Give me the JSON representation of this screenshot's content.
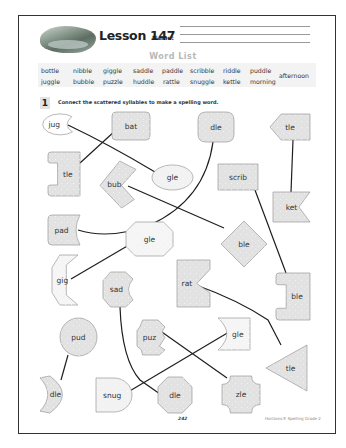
{
  "header": {
    "lesson_title": "Lesson 147",
    "name_label": "Name:"
  },
  "word_list": {
    "title": "Word List",
    "words": [
      {
        "text": "bottle",
        "x": 41,
        "y": 67
      },
      {
        "text": "nibble",
        "x": 73,
        "y": 67
      },
      {
        "text": "giggle",
        "x": 103,
        "y": 67
      },
      {
        "text": "saddle",
        "x": 133,
        "y": 67
      },
      {
        "text": "paddle",
        "x": 162,
        "y": 67
      },
      {
        "text": "scribble",
        "x": 190,
        "y": 67
      },
      {
        "text": "riddle",
        "x": 223,
        "y": 67
      },
      {
        "text": "puddle",
        "x": 250,
        "y": 67
      },
      {
        "text": "juggle",
        "x": 41,
        "y": 78
      },
      {
        "text": "bubble",
        "x": 73,
        "y": 78
      },
      {
        "text": "puzzle",
        "x": 103,
        "y": 78
      },
      {
        "text": "huddle",
        "x": 133,
        "y": 78
      },
      {
        "text": "rattle",
        "x": 163,
        "y": 78
      },
      {
        "text": "snuggle",
        "x": 190,
        "y": 78
      },
      {
        "text": "kettle",
        "x": 223,
        "y": 78
      },
      {
        "text": "morning",
        "x": 250,
        "y": 78
      },
      {
        "text": "afternoon",
        "x": 279,
        "y": 72
      }
    ]
  },
  "instruction": {
    "number": "1",
    "text": "Connect the scattered syllables to make a spelling word."
  },
  "syllables": [
    {
      "id": "jug",
      "text": "jug",
      "shape": "pacman",
      "fill": "#ffffff",
      "x": 41,
      "y": 114,
      "w": 35,
      "h": 21
    },
    {
      "id": "bat",
      "text": "bat",
      "shape": "roundrect",
      "fill": "#e2e2e2",
      "x": 112,
      "y": 112,
      "w": 38,
      "h": 28
    },
    {
      "id": "dle-1",
      "text": "dle",
      "shape": "roundrect-lg",
      "fill": "#e2e2e2",
      "x": 198,
      "y": 112,
      "w": 36,
      "h": 30
    },
    {
      "id": "tle-1",
      "text": "tle",
      "shape": "arrow-left",
      "fill": "#e2e2e2",
      "x": 270,
      "y": 114,
      "w": 40,
      "h": 26
    },
    {
      "id": "tle-2",
      "text": "tle",
      "shape": "bracket-left",
      "fill": "#e2e2e2",
      "x": 48,
      "y": 152,
      "w": 32,
      "h": 44
    },
    {
      "id": "bub",
      "text": "bub",
      "shape": "chevron",
      "fill": "#e2e2e2",
      "x": 100,
      "y": 161,
      "w": 36,
      "h": 47
    },
    {
      "id": "gle-1",
      "text": "gle",
      "shape": "ellipse",
      "fill": "#f2f2f2",
      "x": 152,
      "y": 165,
      "w": 41,
      "h": 25
    },
    {
      "id": "scrib",
      "text": "scrib",
      "shape": "rect",
      "fill": "#e2e2e2",
      "x": 218,
      "y": 164,
      "w": 40,
      "h": 26
    },
    {
      "id": "ket",
      "text": "ket",
      "shape": "flag",
      "fill": "#e2e2e2",
      "x": 273,
      "y": 192,
      "w": 37,
      "h": 30
    },
    {
      "id": "pad",
      "text": "pad",
      "shape": "notch-right-curve",
      "fill": "#e2e2e2",
      "x": 48,
      "y": 215,
      "w": 32,
      "h": 30
    },
    {
      "id": "gle-2",
      "text": "gle",
      "shape": "octagon-wide",
      "fill": "#f5f5f5",
      "x": 126,
      "y": 222,
      "w": 47,
      "h": 34
    },
    {
      "id": "ble-1",
      "text": "ble",
      "shape": "diamond",
      "fill": "#e2e2e2",
      "x": 221,
      "y": 221,
      "w": 46,
      "h": 46
    },
    {
      "id": "gig",
      "text": "gig",
      "shape": "bracket-hex",
      "fill": "#f5f5f5",
      "x": 52,
      "y": 255,
      "w": 26,
      "h": 50
    },
    {
      "id": "sad",
      "text": "sad",
      "shape": "octo-bite",
      "fill": "#e2e2e2",
      "x": 103,
      "y": 272,
      "w": 30,
      "h": 35
    },
    {
      "id": "rat",
      "text": "rat",
      "shape": "notch-v",
      "fill": "#e2e2e2",
      "x": 177,
      "y": 260,
      "w": 33,
      "h": 47
    },
    {
      "id": "ble-2",
      "text": "ble",
      "shape": "bracket-left",
      "fill": "#e2e2e2",
      "x": 276,
      "y": 273,
      "w": 34,
      "h": 47
    },
    {
      "id": "pud",
      "text": "pud",
      "shape": "circle",
      "fill": "#e2e2e2",
      "x": 60,
      "y": 318,
      "w": 37,
      "h": 38
    },
    {
      "id": "puz",
      "text": "puz",
      "shape": "puzzle",
      "fill": "#e2e2e2",
      "x": 137,
      "y": 320,
      "w": 28,
      "h": 35
    },
    {
      "id": "gle-3",
      "text": "gle",
      "shape": "crescent-cut",
      "fill": "#f5f5f5",
      "x": 218,
      "y": 318,
      "w": 32,
      "h": 32
    },
    {
      "id": "tle-3",
      "text": "tle",
      "shape": "triangle-left",
      "fill": "#e2e2e2",
      "x": 266,
      "y": 345,
      "w": 41,
      "h": 46
    },
    {
      "id": "dle-2",
      "text": "dle",
      "shape": "moon",
      "fill": "#e2e2e2",
      "x": 40,
      "y": 376,
      "w": 28,
      "h": 37
    },
    {
      "id": "snug",
      "text": "snug",
      "shape": "bullet",
      "fill": "#f2f2f2",
      "x": 96,
      "y": 378,
      "w": 36,
      "h": 34
    },
    {
      "id": "dle-3",
      "text": "dle",
      "shape": "octagon",
      "fill": "#e2e2e2",
      "x": 158,
      "y": 377,
      "w": 34,
      "h": 36
    },
    {
      "id": "zle",
      "text": "zle",
      "shape": "cross-round",
      "fill": "#e2e2e2",
      "x": 222,
      "y": 376,
      "w": 38,
      "h": 37
    }
  ],
  "connections": [
    {
      "from": "jug",
      "to": "gle-1",
      "path": "M 68 125 Q 110 145 155 172"
    },
    {
      "from": "bat",
      "to": "tle-2",
      "path": "M 116 130 L 80 163"
    },
    {
      "from": "dle-1",
      "to": "pad",
      "path": "M 213 142 Q 205 200 150 225 Q 110 240 78 230"
    },
    {
      "from": "tle-1",
      "to": "ket",
      "path": "M 293 140 L 291 192"
    },
    {
      "from": "bub",
      "to": "ble-1",
      "path": "M 128 186 L 224 228"
    },
    {
      "from": "scrib",
      "to": "ble-2",
      "path": "M 255 190 L 286 273"
    },
    {
      "from": "gig",
      "to": "gle-2",
      "path": "M 71 279 L 129 245"
    },
    {
      "from": "rat",
      "to": "tle-3",
      "path": "M 196 285 Q 238 300 268 320 L 281 345"
    },
    {
      "from": "sad",
      "to": "dle-3",
      "path": "M 120 307 Q 122 360 140 380 L 160 394"
    },
    {
      "from": "pud",
      "to": "dle-2",
      "path": "M 68 355 L 61 380"
    },
    {
      "from": "puz",
      "to": "zle",
      "path": "M 159 330 L 227 378"
    },
    {
      "from": "snug",
      "to": "gle-3",
      "path": "M 128 392 L 229 332"
    }
  ],
  "footer": {
    "page_number": "242",
    "brand": "Horizons® Spelling Grade 2"
  },
  "colors": {
    "shape_stroke": "#9a9a9a",
    "line": "#1e1e1e",
    "shape_gray": "#e2e2e2"
  }
}
